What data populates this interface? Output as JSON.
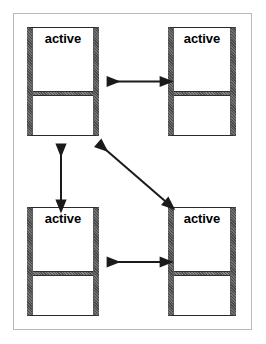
{
  "diagram": {
    "type": "state-diagram",
    "title": "",
    "frame": {
      "border_color": "#b9b9b9",
      "background": "#ffffff"
    },
    "node_style": {
      "side_bar_color": "#4a4a4a",
      "outline_color": "#2b2b2b",
      "divider_color": "#555555",
      "fill_color": "#ffffff"
    },
    "arrow_style": {
      "color": "#1a1a1a",
      "double_headed": true,
      "line_width_px": 2
    },
    "nodes": [
      {
        "id": "node-top-left",
        "label": "active",
        "position": "top-left"
      },
      {
        "id": "node-top-right",
        "label": "active",
        "position": "top-right"
      },
      {
        "id": "node-bottom-left",
        "label": "active",
        "position": "bottom-left"
      },
      {
        "id": "node-bottom-right",
        "label": "active",
        "position": "bottom-right"
      }
    ],
    "connections": [
      {
        "id": "edge-top-horizontal",
        "from": "node-top-left",
        "to": "node-top-right",
        "orientation": "horizontal",
        "arrowheads": "both"
      },
      {
        "id": "edge-left-vertical",
        "from": "node-top-left",
        "to": "node-bottom-left",
        "orientation": "vertical",
        "arrowheads": "both"
      },
      {
        "id": "edge-diagonal",
        "from": "node-top-left",
        "to": "node-bottom-right",
        "orientation": "diagonal",
        "arrowheads": "both"
      },
      {
        "id": "edge-bottom-horizontal",
        "from": "node-bottom-left",
        "to": "node-bottom-right",
        "orientation": "horizontal",
        "arrowheads": "both"
      }
    ]
  }
}
